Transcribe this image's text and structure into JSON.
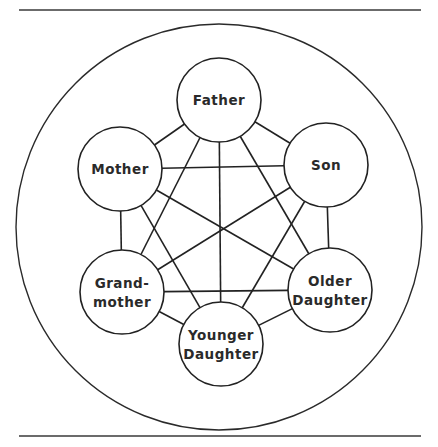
{
  "diagram": {
    "type": "family-communication-network",
    "rules": {
      "top_y": 10,
      "bottom_y": 436,
      "x1": 19,
      "x2": 421,
      "color": "#3a3a3a"
    },
    "outer_circle": {
      "cx": 219,
      "cy": 227,
      "r": 203,
      "stroke": "#2a2a2a"
    },
    "node_radius": 42,
    "nodes": [
      {
        "id": "father",
        "label_lines": [
          "Father"
        ],
        "cx": 219,
        "cy": 100
      },
      {
        "id": "son",
        "label_lines": [
          "Son"
        ],
        "cx": 326,
        "cy": 165
      },
      {
        "id": "older-daughter",
        "label_lines": [
          "Older",
          "Daughter"
        ],
        "cx": 330,
        "cy": 290
      },
      {
        "id": "younger-daughter",
        "label_lines": [
          "Younger",
          "Daughter"
        ],
        "cx": 221,
        "cy": 344
      },
      {
        "id": "grandmother",
        "label_lines": [
          "Grand-",
          "mother"
        ],
        "cx": 122,
        "cy": 292
      },
      {
        "id": "mother",
        "label_lines": [
          "Mother"
        ],
        "cx": 120,
        "cy": 169
      }
    ],
    "edges": [
      [
        "father",
        "son"
      ],
      [
        "father",
        "older-daughter"
      ],
      [
        "father",
        "younger-daughter"
      ],
      [
        "father",
        "grandmother"
      ],
      [
        "father",
        "mother"
      ],
      [
        "son",
        "older-daughter"
      ],
      [
        "son",
        "younger-daughter"
      ],
      [
        "son",
        "grandmother"
      ],
      [
        "son",
        "mother"
      ],
      [
        "older-daughter",
        "younger-daughter"
      ],
      [
        "older-daughter",
        "grandmother"
      ],
      [
        "older-daughter",
        "mother"
      ],
      [
        "younger-daughter",
        "grandmother"
      ],
      [
        "younger-daughter",
        "mother"
      ],
      [
        "grandmother",
        "mother"
      ]
    ],
    "stroke_color": "#222222"
  }
}
